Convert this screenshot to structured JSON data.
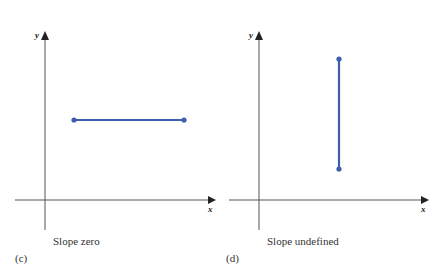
{
  "colors": {
    "axis": "#555555",
    "segment": "#3d5ea8",
    "text": "#333333"
  },
  "panels": [
    {
      "id": "c",
      "tag": "(c)",
      "caption": "Slope zero",
      "x_axis_label": "x",
      "y_axis_label": "y",
      "segment": {
        "orientation": "horizontal",
        "x1": 74,
        "y1": 120,
        "x2": 184,
        "y2": 120
      }
    },
    {
      "id": "d",
      "tag": "(d)",
      "caption": "Slope undefined",
      "x_axis_label": "x",
      "y_axis_label": "y",
      "segment": {
        "orientation": "vertical",
        "x1": 339,
        "y1": 59,
        "x2": 339,
        "y2": 169
      }
    }
  ]
}
